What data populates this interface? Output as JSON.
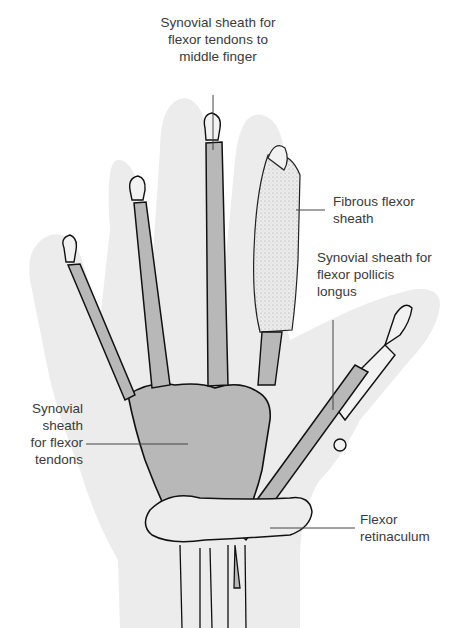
{
  "figure": {
    "colors": {
      "skin_outline": "#ebebeb",
      "synovial_sheath": "#b8b8b8",
      "bone": "#f2f2f2",
      "outline": "#111111",
      "fibrous_sheath": "#e2e2e2",
      "leader_line": "#444444",
      "text": "#3a3a3a"
    }
  },
  "labels": {
    "middle_finger_sheath": "Synovial sheath for\nflexor tendons to\nmiddle finger",
    "fibrous_flexor_sheath": "Fibrous flexor\nsheath",
    "fpl_sheath": "Synovial sheath for\nflexor pollicis\nlongus",
    "common_sheath": "Synovial\nsheath\nfor flexor\ntendons",
    "flexor_retinaculum": "Flexor\nretinaculum"
  }
}
